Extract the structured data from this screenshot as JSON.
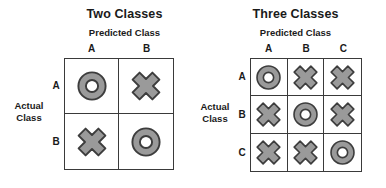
{
  "figure": {
    "background": "#ffffff",
    "stroke_color": "#3a3a3a",
    "icon_fill": "#9a9a9a",
    "icon_outline": "#3d3d3d",
    "icon_hole": "#ffffff"
  },
  "panels": [
    {
      "key": "two_classes",
      "title": "Two Classes",
      "predicted_label": "Predicted Class",
      "actual_label_line1": "Actual",
      "actual_label_line2": "Class",
      "columns": [
        "A",
        "B"
      ],
      "rows": [
        "A",
        "B"
      ],
      "cells": [
        [
          {
            "icon": "correct-ring-icon"
          },
          {
            "icon": "incorrect-cross-icon"
          }
        ],
        [
          {
            "icon": "incorrect-cross-icon"
          },
          {
            "icon": "correct-ring-icon"
          }
        ]
      ]
    },
    {
      "key": "three_classes",
      "title": "Three Classes",
      "predicted_label": "Predicted Class",
      "actual_label_line1": "Actual",
      "actual_label_line2": "Class",
      "columns": [
        "A",
        "B",
        "C"
      ],
      "rows": [
        "A",
        "B",
        "C"
      ],
      "cells": [
        [
          {
            "icon": "correct-ring-icon"
          },
          {
            "icon": "incorrect-cross-icon"
          },
          {
            "icon": "incorrect-cross-icon"
          }
        ],
        [
          {
            "icon": "incorrect-cross-icon"
          },
          {
            "icon": "correct-ring-icon"
          },
          {
            "icon": "incorrect-cross-icon"
          }
        ],
        [
          {
            "icon": "incorrect-cross-icon"
          },
          {
            "icon": "incorrect-cross-icon"
          },
          {
            "icon": "correct-ring-icon"
          }
        ]
      ]
    }
  ],
  "chart_data": {
    "type": "table",
    "matrices": [
      {
        "name": "Two Classes",
        "xlabel": "Predicted Class",
        "ylabel": "Actual Class",
        "columns": [
          "A",
          "B"
        ],
        "rows": [
          "A",
          "B"
        ],
        "values": [
          [
            "correct",
            "incorrect"
          ],
          [
            "incorrect",
            "correct"
          ]
        ]
      },
      {
        "name": "Three Classes",
        "xlabel": "Predicted Class",
        "ylabel": "Actual Class",
        "columns": [
          "A",
          "B",
          "C"
        ],
        "rows": [
          "A",
          "B",
          "C"
        ],
        "values": [
          [
            "correct",
            "incorrect",
            "incorrect"
          ],
          [
            "incorrect",
            "correct",
            "incorrect"
          ],
          [
            "incorrect",
            "incorrect",
            "correct"
          ]
        ]
      }
    ],
    "legend": [
      {
        "symbol": "ring",
        "meaning": "correct"
      },
      {
        "symbol": "cross",
        "meaning": "incorrect"
      }
    ],
    "grid": true,
    "legend_position": "none"
  }
}
